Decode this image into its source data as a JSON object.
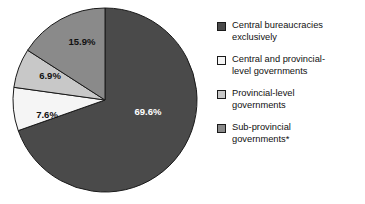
{
  "chart_data": {
    "type": "pie",
    "title": "",
    "subtitle": "",
    "xlabel": "",
    "ylabel": "",
    "grid": false,
    "legend_position": "right",
    "start_angle_deg": 0,
    "direction": "clockwise",
    "value_unit": "percent",
    "categories": [
      "Central bureaucracies exclusively",
      "Central and provincial-level governments",
      "Provincial-level governments",
      "Sub-provincial governments*"
    ],
    "values": [
      69.6,
      7.6,
      6.9,
      15.9
    ],
    "labels": [
      "69.6%",
      "7.6%",
      "6.9%",
      "15.9%"
    ],
    "colors": [
      "#4a4a4a",
      "#f5f5f5",
      "#c8c8c8",
      "#8a8a8a"
    ],
    "label_colors": [
      "#ffffff",
      "#111111",
      "#111111",
      "#111111"
    ],
    "slices": [
      {
        "name": "Central bureaucracies exclusively",
        "value": 69.6,
        "label": "69.6%",
        "color": "#4a4a4a",
        "label_color": "#ffffff",
        "start_deg": 0,
        "sweep_deg": 250.56,
        "label_x": 148,
        "label_y": 112
      },
      {
        "name": "Central and provincial-level governments",
        "value": 7.6,
        "label": "7.6%",
        "color": "#f5f5f5",
        "label_color": "#111111",
        "start_deg": 250.56,
        "sweep_deg": 27.36,
        "label_x": 47,
        "label_y": 115
      },
      {
        "name": "Provincial-level governments",
        "value": 6.9,
        "label": "6.9%",
        "color": "#c8c8c8",
        "label_color": "#111111",
        "start_deg": 277.92,
        "sweep_deg": 24.84,
        "label_x": 50,
        "label_y": 76
      },
      {
        "name": "Sub-provincial governments*",
        "value": 15.9,
        "label": "15.9%",
        "color": "#8a8a8a",
        "label_color": "#111111",
        "start_deg": 302.76,
        "sweep_deg": 57.24,
        "label_x": 82,
        "label_y": 42
      }
    ],
    "geometry": {
      "center_x": 105,
      "center_y": 100,
      "radius": 92,
      "outline_color": "#1a1a1a"
    }
  },
  "legend": {
    "items": [
      {
        "swatch_name": "legend-swatch-central-bureaucracies",
        "label": "Central bureaucracies\nexclusively",
        "color": "#4a4a4a"
      },
      {
        "swatch_name": "legend-swatch-central-and-provincial",
        "label": "Central and provincial-\nlevel governments",
        "color": "#f5f5f5"
      },
      {
        "swatch_name": "legend-swatch-provincial-level",
        "label": "Provincial-level\ngovernments",
        "color": "#c8c8c8"
      },
      {
        "swatch_name": "legend-swatch-sub-provincial",
        "label": "Sub-provincial\ngovernments*",
        "color": "#8a8a8a"
      }
    ]
  }
}
